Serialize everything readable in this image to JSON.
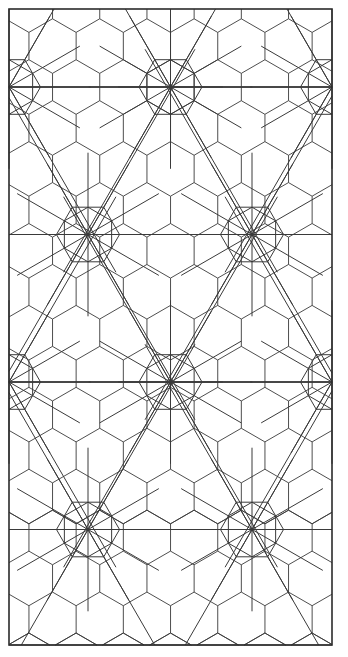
{
  "document": {
    "title": "Geometric Tessellation Pattern",
    "type": "line-drawing",
    "width": 348,
    "height": 657,
    "background_color": "#ffffff"
  },
  "style": {
    "line_color": "#3a3a3a",
    "border_color": "#2b2b2b",
    "line_width": 0.9,
    "border_width": 1.6,
    "rosette_line_width": 1.0
  },
  "frame": {
    "left": 9,
    "top": 9,
    "right": 332,
    "bottom": 645
  },
  "hex_grid": {
    "orientation": "pointy-side-horizontal",
    "hex_width": 47.2,
    "hex_height": 54.6,
    "circumradius": 27.3,
    "column_step": 40.9,
    "row_step": 27.3,
    "origin_x": 9,
    "origin_y": 9,
    "description": "Regular hexagonal tiling filling the frame, flat left-right edges with apex top and bottom."
  },
  "rosette_lattice": {
    "spoke_count": 12,
    "description": "Twelve-spoke star rosettes whose spokes radiate from a point through a surrounding hexagon and continue as long chords into the neighbouring tiles.",
    "column_spacing": 163.6,
    "row_spacing": 147.5,
    "inner_hex_radius": 27.3,
    "outer_chord_radius": 81.8,
    "centers": [
      {
        "x": 9,
        "y": 87,
        "kind": "half-right"
      },
      {
        "x": 170.5,
        "y": 87,
        "kind": "full"
      },
      {
        "x": 332,
        "y": 87,
        "kind": "half-left"
      },
      {
        "x": 88,
        "y": 234.5,
        "kind": "full"
      },
      {
        "x": 252,
        "y": 234.5,
        "kind": "full"
      },
      {
        "x": 9,
        "y": 382,
        "kind": "half-right"
      },
      {
        "x": 170.5,
        "y": 382,
        "kind": "full"
      },
      {
        "x": 332,
        "y": 382,
        "kind": "half-left"
      },
      {
        "x": 88,
        "y": 529.5,
        "kind": "full"
      },
      {
        "x": 252,
        "y": 529.5,
        "kind": "full"
      }
    ]
  },
  "horizontal_rules": {
    "description": "Full-width horizontal lines passing through every rosette row.",
    "y_values": [
      87,
      234.5,
      382,
      529.5,
      645
    ]
  },
  "labels": {
    "caption": "",
    "figure_number": ""
  }
}
